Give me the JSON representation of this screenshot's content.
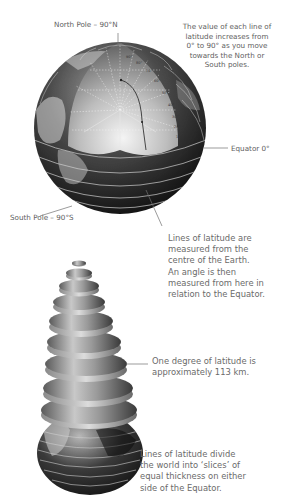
{
  "diagram": {
    "globe": {
      "north_pole_label": "North Pole – 90°N",
      "south_pole_label": "South Pole – 90°S",
      "equator_label": "Equator 0°",
      "degree_ticks": [
        "90°",
        "80°",
        "70°",
        "60°",
        "50°",
        "40°",
        "30°",
        "20°",
        "10°",
        "0°"
      ],
      "increase_note": "The value of each line of\nlatitude increases from\n0° to 90° as you move\ntowards the North or\nSouth poles.",
      "measure_note": "Lines of latitude are\nmeasured from the\ncentre of the Earth.\nAn angle is then\nmeasured from here in\nrelation to the Equator."
    },
    "slices": {
      "degree_note": "One degree of latitude is\napproximately 113 km.",
      "divide_note": "Lines of latitude divide\nthe world into ‘slices’ of\nequal thickness on either\nside of the Equator."
    },
    "colors": {
      "background": "#ffffff",
      "text": "#606060",
      "leader_line": "#707070",
      "latitude_line": "#d8d8d8"
    }
  }
}
